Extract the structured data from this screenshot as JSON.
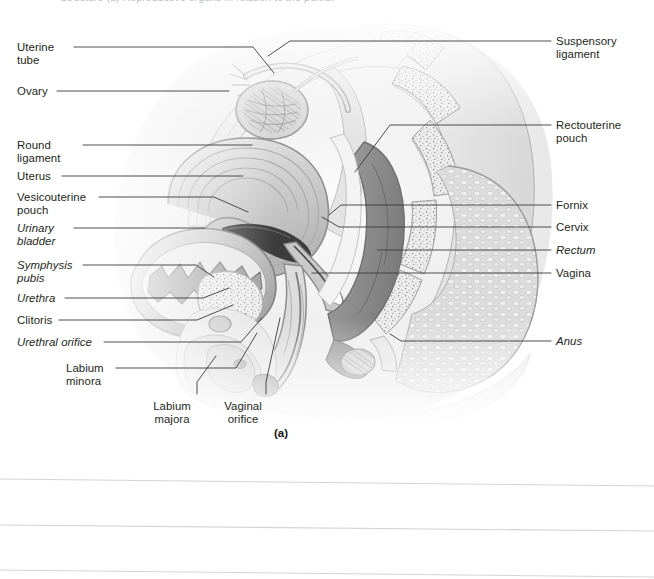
{
  "figure": {
    "caption_top": "Structure   (a) Reproductive organs in relation to the pelvis.",
    "panel_label": "(a)",
    "illustration_name": "female-pelvis-sagittal-section",
    "style": "grayscale halftone anatomical illustration, midsagittal section of the female pelvis",
    "colors": {
      "page_background": "#ffffff",
      "label_text": "#231f20",
      "leader_line": "#3a3a3a",
      "rule_line": "#d2d5d8",
      "caption_ghost": "#b9bcc1",
      "art_light": "#f2f2f2",
      "art_mid": "#c8c8c8",
      "art_dark": "#8e8e8e",
      "art_darkest": "#6d6d6d",
      "art_outline": "#7a7a7a"
    }
  },
  "labels_left": [
    {
      "id": "uterine-tube",
      "text": "Uterine\ntube",
      "italic": false,
      "x": 17,
      "y": 41,
      "lines": 2
    },
    {
      "id": "ovary",
      "text": "Ovary",
      "italic": false,
      "x": 17,
      "y": 85,
      "lines": 1
    },
    {
      "id": "round-ligament",
      "text": "Round\nligament",
      "italic": false,
      "x": 17,
      "y": 139,
      "lines": 2
    },
    {
      "id": "uterus",
      "text": "Uterus",
      "italic": false,
      "x": 17,
      "y": 170,
      "lines": 1
    },
    {
      "id": "vesicouterine-pouch",
      "text": "Vesicouterine\npouch",
      "italic": false,
      "x": 17,
      "y": 191,
      "lines": 2
    },
    {
      "id": "urinary-bladder",
      "text": "Urinary\nbladder",
      "italic": true,
      "x": 17,
      "y": 222,
      "lines": 2
    },
    {
      "id": "symphysis-pubis",
      "text": "Symphysis\npubis",
      "italic": true,
      "x": 17,
      "y": 259,
      "lines": 2
    },
    {
      "id": "urethra",
      "text": "Urethra",
      "italic": true,
      "x": 17,
      "y": 292,
      "lines": 1
    },
    {
      "id": "clitoris",
      "text": "Clitoris",
      "italic": false,
      "x": 17,
      "y": 314,
      "lines": 1
    },
    {
      "id": "urethral-orifice",
      "text": "Urethral orifice",
      "italic": true,
      "x": 17,
      "y": 336,
      "lines": 1
    },
    {
      "id": "labium-minora",
      "text": "Labium\nminora",
      "italic": false,
      "x": 66,
      "y": 362,
      "lines": 2
    }
  ],
  "labels_bottom": [
    {
      "id": "labium-majora",
      "text": "Labium\nmajora",
      "italic": false,
      "x": 172,
      "y": 400,
      "lines": 2
    },
    {
      "id": "vaginal-orifice",
      "text": "Vaginal\norifice",
      "italic": false,
      "x": 243,
      "y": 400,
      "lines": 2
    }
  ],
  "labels_right": [
    {
      "id": "suspensory-ligament",
      "text": "Suspensory\nligament",
      "italic": false,
      "x": 556,
      "y": 35,
      "lines": 2
    },
    {
      "id": "rectouterine-pouch",
      "text": "Rectouterine\npouch",
      "italic": false,
      "x": 556,
      "y": 119,
      "lines": 2
    },
    {
      "id": "fornix",
      "text": "Fornix",
      "italic": false,
      "x": 556,
      "y": 199,
      "lines": 1
    },
    {
      "id": "cervix",
      "text": "Cervix",
      "italic": false,
      "x": 556,
      "y": 221,
      "lines": 1
    },
    {
      "id": "rectum",
      "text": "Rectum",
      "italic": true,
      "x": 556,
      "y": 244,
      "lines": 1
    },
    {
      "id": "vagina",
      "text": "Vagina",
      "italic": false,
      "x": 556,
      "y": 267,
      "lines": 1
    },
    {
      "id": "anus",
      "text": "Anus",
      "italic": true,
      "x": 556,
      "y": 335,
      "lines": 1
    }
  ],
  "leader_lines": [
    {
      "id": "leader-uterine-tube",
      "points": "74,47 253,47 274,73"
    },
    {
      "id": "leader-ovary",
      "points": "57,91 229,91"
    },
    {
      "id": "leader-round-ligament",
      "points": "83,145 252,145"
    },
    {
      "id": "leader-uterus",
      "points": "62,176 243,176"
    },
    {
      "id": "leader-vesicouterine-pouch",
      "points": "99,197 214,197 248,212"
    },
    {
      "id": "leader-urinary-bladder",
      "points": "74,228 205,228"
    },
    {
      "id": "leader-symphysis-pubis",
      "points": "83,265 196,265 214,277"
    },
    {
      "id": "leader-urethra",
      "points": "65,298 203,298 229,288"
    },
    {
      "id": "leader-clitoris",
      "points": "59,320 197,320 233,305"
    },
    {
      "id": "leader-urethral-orifice",
      "points": "104,342 241,342 262,318"
    },
    {
      "id": "leader-labium-minora",
      "points": "116,368 236,368 257,333"
    },
    {
      "id": "leader-labium-majora",
      "points": "197,394 197,382 216,356"
    },
    {
      "id": "leader-vaginal-orifice",
      "points": "266,394 266,382 280,318"
    },
    {
      "id": "leader-suspensory-ligament",
      "points": "551,41 290,41 268,56"
    },
    {
      "id": "leader-rectouterine-pouch",
      "points": "551,125 390,125 355,172"
    },
    {
      "id": "leader-fornix",
      "points": "551,205 341,205 329,215"
    },
    {
      "id": "leader-cervix",
      "points": "551,227 339,227 322,217"
    },
    {
      "id": "leader-rectum",
      "points": "551,250 378,250"
    },
    {
      "id": "leader-vagina",
      "points": "551,273 312,273"
    },
    {
      "id": "leader-anus",
      "points": "551,341 401,341 390,334"
    }
  ],
  "rule_lines": [
    {
      "id": "rule-1",
      "x1": 0,
      "y1": 479,
      "x2": 654,
      "y2": 486
    },
    {
      "id": "rule-2",
      "x1": 0,
      "y1": 525,
      "x2": 654,
      "y2": 531
    },
    {
      "id": "rule-3",
      "x1": 0,
      "y1": 570,
      "x2": 654,
      "y2": 577
    }
  ]
}
